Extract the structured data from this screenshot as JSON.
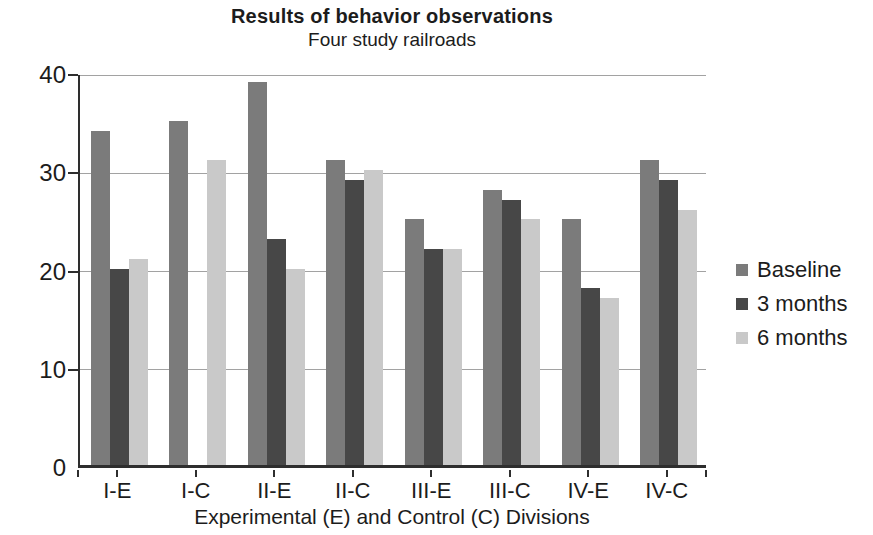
{
  "chart_data": {
    "type": "bar",
    "title": "Results of behavior observations",
    "subtitle": "Four study railroads",
    "xlabel": "Experimental (E) and Control (C) Divisions",
    "ylabel": "",
    "categories": [
      "I-E",
      "I-C",
      "II-E",
      "II-C",
      "III-E",
      "III-C",
      "IV-E",
      "IV-C"
    ],
    "series": [
      {
        "name": "Baseline",
        "color": "#7b7b7b",
        "values": [
          34,
          35,
          39,
          31,
          25,
          28,
          25,
          31
        ]
      },
      {
        "name": "3 months",
        "color": "#474747",
        "values": [
          20,
          null,
          23,
          29,
          22,
          27,
          18,
          29
        ]
      },
      {
        "name": "6 months",
        "color": "#c9c9c9",
        "values": [
          21,
          31,
          20,
          30,
          22,
          25,
          17,
          26
        ]
      }
    ],
    "ylim": [
      0,
      40
    ],
    "yticks": [
      0,
      10,
      20,
      30,
      40
    ],
    "grid": true,
    "legend_position": "right",
    "note_missing_data": "I-C has no 3 months bar",
    "axis_color": "#2e2e2e",
    "gridline_color": "#a2a2a2",
    "text_color": "#1c1c1c",
    "background_color": "#ffffff"
  }
}
